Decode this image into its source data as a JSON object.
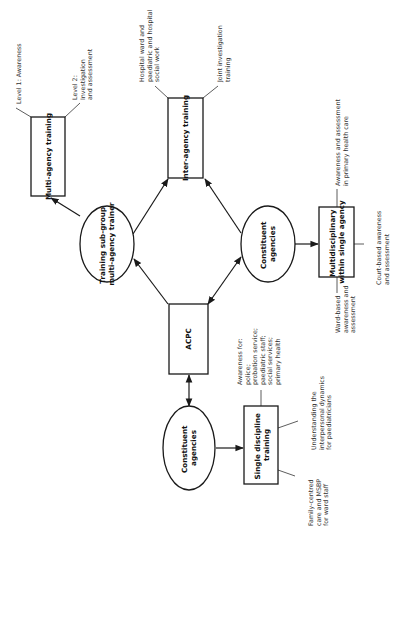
{
  "diagram": {
    "orientation": "rotated 90 degrees counter-clockwise",
    "nodes": {
      "acpc": {
        "label": [
          "ACPC"
        ],
        "shape": "rectangle"
      },
      "training_subgroup": {
        "label": [
          "Training sub-group",
          "multi-agency trainer"
        ],
        "shape": "ellipse"
      },
      "constituent_right": {
        "label": [
          "Constituent",
          "agencies"
        ],
        "shape": "ellipse"
      },
      "constituent_bottom": {
        "label": [
          "Constituent",
          "agencies"
        ],
        "shape": "ellipse"
      },
      "multi_agency": {
        "label": [
          "Multi-agency training"
        ],
        "shape": "rectangle"
      },
      "inter_agency": {
        "label": [
          "Inter-agency training"
        ],
        "shape": "rectangle"
      },
      "multidisciplinary": {
        "label": [
          "Multidisciplinary",
          "within single agency"
        ],
        "shape": "rectangle"
      },
      "single_discipline": {
        "label": [
          "Single discipline",
          "training"
        ],
        "shape": "rectangle"
      }
    },
    "notes": {
      "multi_level1": [
        "Level 1: Awareness"
      ],
      "multi_level2": [
        "Level 2:",
        "Investigation",
        "and assessment"
      ],
      "inter_hospital": [
        "Hospital ward and",
        "paediatric and hospital",
        "social work"
      ],
      "inter_joint": [
        "Joint investigation",
        "training"
      ],
      "md_primary": [
        "Awareness and assessment",
        "in primary health care"
      ],
      "md_court": [
        "Court-based awareness",
        "and assessment"
      ],
      "md_ward": [
        "Ward-based",
        "awareness and",
        "assessment"
      ],
      "sd_awareness": [
        "Awareness for:",
        "police;",
        "probation service;",
        "paediatric staff;",
        "social services;",
        "primary health"
      ],
      "sd_understanding": [
        "Understanding the",
        "interpersonal dynamics",
        "for paediatricians"
      ],
      "sd_family": [
        "Family-centred",
        "care and MSBP",
        "for ward staff"
      ]
    },
    "edges": [
      {
        "from": "acpc",
        "to": "training_subgroup",
        "type": "arrow"
      },
      {
        "from": "constituent_right",
        "to": "acpc",
        "type": "double-arrow"
      },
      {
        "from": "training_subgroup",
        "to": "multi_agency",
        "type": "arrow"
      },
      {
        "from": "training_subgroup",
        "to": "inter_agency",
        "type": "arrow"
      },
      {
        "from": "constituent_right",
        "to": "inter_agency",
        "type": "arrow"
      },
      {
        "from": "constituent_right",
        "to": "multidisciplinary",
        "type": "arrow"
      },
      {
        "from": "acpc",
        "to": "constituent_bottom",
        "type": "double-arrow"
      },
      {
        "from": "constituent_bottom",
        "to": "single_discipline",
        "type": "arrow"
      }
    ],
    "colors": {
      "stroke": "#1a1a1a",
      "text": "#111111",
      "note_text": "#333333",
      "background": "#ffffff"
    }
  }
}
